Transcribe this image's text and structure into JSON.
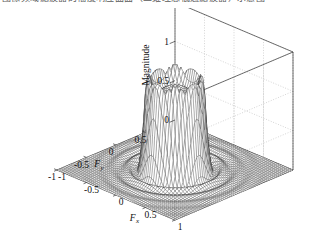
{
  "page": {
    "cutoff_text": "图像频域滤波器的幅度响应曲面（二维理想低通滤波器）示意图",
    "background": "#ffffff",
    "ink": "#111111",
    "grid_color": "#b9b9b9",
    "mesh_color": "#2b2b2b"
  },
  "chart_data": {
    "type": "surface",
    "title": "",
    "xlabel": "F_x",
    "ylabel": "F_y",
    "zlabel": "Magnitude",
    "xlabel_display": "F",
    "xlabel_sub": "x",
    "ylabel_display": "F",
    "ylabel_sub": "y",
    "xlim": [
      -1,
      1
    ],
    "ylim": [
      -1,
      1
    ],
    "zlim": [
      0,
      1.5
    ],
    "xticks": [
      -1,
      -0.5,
      0,
      0.5,
      1
    ],
    "xticklabels": [
      "-1",
      "-0.5",
      "0",
      "0.5",
      "1"
    ],
    "yticks": [
      -1,
      -0.5,
      0,
      0.5
    ],
    "yticklabels": [
      "-1",
      "-0.5",
      "0",
      "0.5"
    ],
    "zticks": [
      0,
      0.5,
      1,
      1.5
    ],
    "zticklabels": [
      "0",
      "0.5",
      "1",
      "1.5"
    ],
    "grid": true,
    "legend": null,
    "view": {
      "azimuth": -37.5,
      "elevation": 30
    },
    "plateau_value": 1.0,
    "ripple_peak": 1.15,
    "cutoff_radius": 0.35,
    "grid_n": 61,
    "sidelobe_amplitude": 0.12
  },
  "axes": {
    "z_ticks_px": {
      "1.5": 55,
      "1": 92,
      "0.5": 140,
      "0": 170
    },
    "box": {
      "left_x": 57,
      "right_x": 298,
      "back_apex_x": 175,
      "back_apex_y": 40
    }
  }
}
